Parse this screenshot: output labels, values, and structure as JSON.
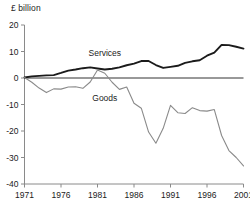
{
  "figure": {
    "unit_label": "£ billion",
    "background_color": "#ffffff"
  },
  "chart_data": {
    "type": "line",
    "title": "",
    "subtitle": "",
    "xlabel": "",
    "ylabel": "£ billion",
    "xlim": [
      1971,
      2001
    ],
    "ylim": [
      -40,
      20
    ],
    "xticks": [
      1971,
      1976,
      1981,
      1986,
      1991,
      1996,
      2001
    ],
    "xticklabels": [
      "1971",
      "1976",
      "1981",
      "1986",
      "1991",
      "1996",
      "2001"
    ],
    "yticks": [
      20,
      10,
      0,
      -10,
      -20,
      -30,
      -40
    ],
    "yticklabels": [
      "20",
      "10",
      "0",
      "-10",
      "-20",
      "-30",
      "-40"
    ],
    "grid": false,
    "zero_line": true,
    "legend": "inline-annotations",
    "x": [
      1971,
      1972,
      1973,
      1974,
      1975,
      1976,
      1977,
      1978,
      1979,
      1980,
      1981,
      1982,
      1983,
      1984,
      1985,
      1986,
      1987,
      1988,
      1989,
      1990,
      1991,
      1992,
      1993,
      1994,
      1995,
      1996,
      1997,
      1998,
      1999,
      2000,
      2001
    ],
    "series": [
      {
        "name": "Services",
        "color": "#1b1b1b",
        "line_width": 1.9,
        "label_x": 1982.0,
        "label_y": 8.2,
        "values": [
          0.2,
          0.6,
          0.8,
          1.0,
          1.1,
          1.9,
          2.8,
          3.2,
          3.7,
          4.0,
          3.6,
          3.2,
          3.5,
          4.0,
          4.8,
          5.4,
          6.4,
          6.4,
          4.9,
          3.8,
          4.2,
          4.6,
          5.7,
          6.3,
          6.7,
          8.4,
          9.6,
          12.5,
          12.4,
          11.8,
          11.1
        ]
      },
      {
        "name": "Goods",
        "color": "#8a8a8a",
        "line_width": 1.1,
        "label_x": 1982.0,
        "label_y": -8.6,
        "values": [
          0.2,
          -1.6,
          -3.8,
          -5.5,
          -4.1,
          -4.2,
          -3.4,
          -3.3,
          -3.9,
          -1.5,
          3.0,
          1.8,
          -1.6,
          -4.3,
          -3.4,
          -9.5,
          -11.4,
          -20.4,
          -24.6,
          -19.0,
          -10.3,
          -13.1,
          -13.4,
          -11.2,
          -12.3,
          -12.5,
          -11.9,
          -21.7,
          -27.4,
          -30.0,
          -33.2
        ]
      }
    ],
    "annotations": [
      {
        "text": "Services",
        "x": 1982.0,
        "y": 8.2
      },
      {
        "text": "Goods",
        "x": 1982.0,
        "y": -8.6
      }
    ]
  }
}
